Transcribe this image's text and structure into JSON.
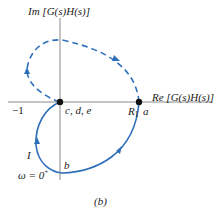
{
  "figure": {
    "caption": "(b)",
    "colors": {
      "axis": "#8a8a8a",
      "curve": "#2e6fba",
      "point": "#111111",
      "text": "#1a1a1a"
    },
    "axes": {
      "imag_label": "Im [G(s)H(s)]",
      "real_label": "Re [G(s)H(s)]",
      "tick_minus_one": "−1"
    },
    "points": {
      "origin_label": "c, d, e",
      "a_label": "a",
      "r1_label_main": "R",
      "r1_label_sub": "1",
      "b_label": "b",
      "i_label": "I",
      "omega_label": "ω = 0",
      "omega_sup": "+"
    },
    "curves": {
      "solid": "positive-frequency Nyquist path from ω = 0⁺ through b to a (clockwise), then to origin c,d,e",
      "dashed": "mirror (negative-frequency) path from a through upper half-plane back to origin"
    }
  }
}
